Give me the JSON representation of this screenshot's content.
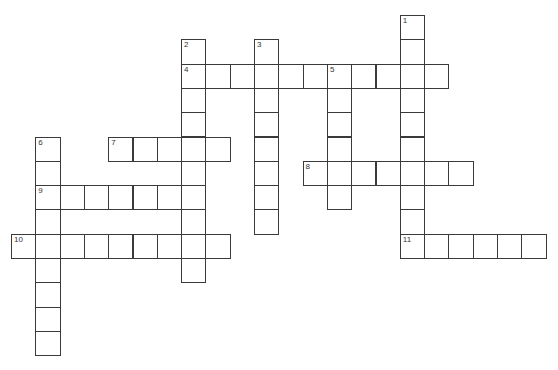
{
  "puzzle": {
    "cell_size": 24.3,
    "origin_x": 11,
    "origin_y": 15,
    "line_color": "#3a3a3a",
    "background": "#ffffff",
    "entries": [
      {
        "number": "1",
        "direction": "down",
        "row": 0,
        "col": 16,
        "length": 10
      },
      {
        "number": "2",
        "direction": "down",
        "row": 1,
        "col": 7,
        "length": 10
      },
      {
        "number": "3",
        "direction": "down",
        "row": 1,
        "col": 10,
        "length": 8
      },
      {
        "number": "4",
        "direction": "across",
        "row": 2,
        "col": 7,
        "length": 11
      },
      {
        "number": "5",
        "direction": "down",
        "row": 2,
        "col": 13,
        "length": 6
      },
      {
        "number": "6",
        "direction": "down",
        "row": 5,
        "col": 1,
        "length": 9
      },
      {
        "number": "7",
        "direction": "across",
        "row": 5,
        "col": 4,
        "length": 5
      },
      {
        "number": "8",
        "direction": "across",
        "row": 6,
        "col": 12,
        "length": 7
      },
      {
        "number": "9",
        "direction": "across",
        "row": 7,
        "col": 1,
        "length": 7
      },
      {
        "number": "10",
        "direction": "across",
        "row": 9,
        "col": 0,
        "length": 9
      },
      {
        "number": "11",
        "direction": "across",
        "row": 9,
        "col": 16,
        "length": 6
      }
    ]
  }
}
